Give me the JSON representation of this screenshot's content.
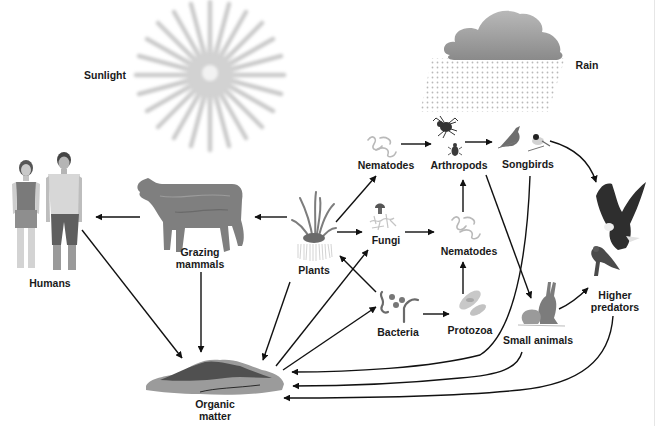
{
  "diagram": {
    "type": "food-web",
    "colors": {
      "background": "#ffffff",
      "arrow": "#111111",
      "label": "#1a1a1a",
      "sun": "#c8c8c8",
      "cloud": "#9a9a9a",
      "organism_fill": "#8a8a8a"
    },
    "nodes": {
      "sunlight": {
        "label": "Sunlight",
        "icon": "sun-icon"
      },
      "rain": {
        "label": "Rain",
        "icon": "rain-cloud-icon"
      },
      "humans": {
        "label": "Humans",
        "icon": "humans-icon"
      },
      "grazing_mammals": {
        "label_line1": "Grazing",
        "label_line2": "mammals",
        "icon": "cow-icon"
      },
      "plants": {
        "label": "Plants",
        "icon": "grass-plant-icon"
      },
      "nematodes_top": {
        "label": "Nematodes",
        "icon": "nematode-icon"
      },
      "arthropods": {
        "label": "Arthropods",
        "icon": "spider-beetle-icon"
      },
      "songbirds": {
        "label": "Songbirds",
        "icon": "songbirds-icon"
      },
      "fungi": {
        "label": "Fungi",
        "icon": "mushroom-hyphae-icon"
      },
      "nematodes_mid": {
        "label": "Nematodes",
        "icon": "nematode-icon"
      },
      "bacteria": {
        "label": "Bacteria",
        "icon": "bacteria-icon"
      },
      "protozoa": {
        "label": "Protozoa",
        "icon": "protozoa-icon"
      },
      "small_animals": {
        "label": "Small animals",
        "icon": "rabbit-mouse-icon"
      },
      "higher_predators": {
        "label_line1": "Higher",
        "label_line2": "predators",
        "icon": "eagle-hawk-icon"
      },
      "organic_matter": {
        "label_line1": "Organic",
        "label_line2": "matter",
        "icon": "organic-matter-pile-icon"
      }
    },
    "edges": [
      {
        "from": "Grazing mammals",
        "to": "Humans"
      },
      {
        "from": "Plants",
        "to": "Grazing mammals"
      },
      {
        "from": "Plants",
        "to": "Nematodes (top)"
      },
      {
        "from": "Plants",
        "to": "Fungi"
      },
      {
        "from": "Nematodes (top)",
        "to": "Arthropods"
      },
      {
        "from": "Arthropods",
        "to": "Songbirds"
      },
      {
        "from": "Songbirds",
        "to": "Higher predators"
      },
      {
        "from": "Fungi",
        "to": "Nematodes (mid)"
      },
      {
        "from": "Nematodes (mid)",
        "to": "Arthropods"
      },
      {
        "from": "Protozoa",
        "to": "Nematodes (mid)"
      },
      {
        "from": "Bacteria",
        "to": "Protozoa"
      },
      {
        "from": "Bacteria",
        "to": "Plants"
      },
      {
        "from": "Arthropods",
        "to": "Small animals"
      },
      {
        "from": "Small animals",
        "to": "Higher predators"
      },
      {
        "from": "Humans",
        "to": "Organic matter"
      },
      {
        "from": "Grazing mammals",
        "to": "Organic matter"
      },
      {
        "from": "Plants",
        "to": "Organic matter"
      },
      {
        "from": "Organic matter",
        "to": "Fungi"
      },
      {
        "from": "Organic matter",
        "to": "Bacteria"
      },
      {
        "from": "Songbirds",
        "to": "Organic matter"
      },
      {
        "from": "Small animals",
        "to": "Organic matter"
      },
      {
        "from": "Higher predators",
        "to": "Organic matter"
      }
    ]
  }
}
